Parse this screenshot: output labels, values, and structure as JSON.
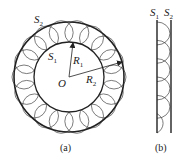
{
  "figure": {
    "panel_a": {
      "caption": "(a)",
      "labels": {
        "outer_surface": {
          "main": "S",
          "sub": "2"
        },
        "inner_surface": {
          "main": "S",
          "sub": "1"
        },
        "inner_radius": {
          "main": "R",
          "sub": "1"
        },
        "outer_radius": {
          "main": "R",
          "sub": "2"
        },
        "center": "O"
      },
      "small_circle_count": 18
    },
    "panel_b": {
      "caption": "(b)",
      "labels": {
        "left_surface": {
          "main": "S",
          "sub": "1"
        },
        "right_surface": {
          "main": "S",
          "sub": "2"
        }
      },
      "arc_count": 6
    },
    "colors": {
      "stroke": "#222222",
      "thin_stroke": "#444444",
      "background": "#ffffff"
    }
  }
}
